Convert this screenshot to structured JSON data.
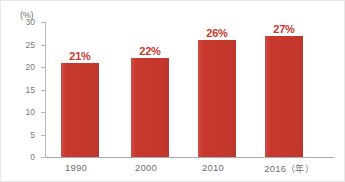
{
  "chart_data": {
    "type": "bar",
    "title": "",
    "xlabel": "年",
    "ylabel": "(%)",
    "categories": [
      "1990",
      "2000",
      "2010",
      "2016"
    ],
    "values": [
      21,
      22,
      26,
      27
    ],
    "data_labels": [
      "21%",
      "22%",
      "26%",
      "27%"
    ],
    "ylim": [
      0,
      30
    ],
    "yticks": [
      0,
      5,
      10,
      15,
      20,
      25,
      30
    ],
    "ytick_labels": [
      "0",
      "5",
      "10",
      "15",
      "20",
      "25",
      "30"
    ],
    "grid": false,
    "legend": null,
    "bar_color": "#c8382e",
    "label_color": "#c8382e",
    "axis_color": "#b9b9b9",
    "tick_text_color": "#7a7a7a"
  },
  "axis": {
    "unit_label": "(%)",
    "x_unit_suffix": "（年）"
  },
  "x_tick_text": {
    "c0": "1990",
    "c1": "2000",
    "c2": "2010",
    "c3": "2016"
  }
}
